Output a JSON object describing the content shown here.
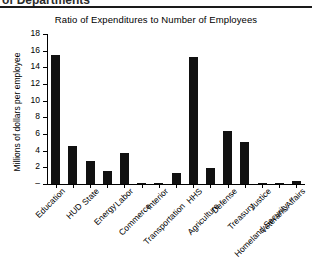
{
  "page": {
    "clipped_header": "of Departments"
  },
  "chart_data": {
    "type": "bar",
    "title": "Ratio of Expenditures to Number of Employees",
    "xlabel": "",
    "ylabel": "Millions of dollars per employee",
    "ylim": [
      0,
      18
    ],
    "ytick_labels": [
      "–",
      "2",
      "4",
      "6",
      "8",
      "10",
      "12",
      "14",
      "16",
      "18"
    ],
    "ytick_values": [
      0,
      2,
      4,
      6,
      8,
      10,
      12,
      14,
      16,
      18
    ],
    "grid": false,
    "legend": "none",
    "bar_color": "#111111",
    "categories": [
      "Education",
      "HUD",
      "State",
      "Energy",
      "Labor",
      "Commerce",
      "Interior",
      "Transportation",
      "HHS",
      "Agriculture",
      "Defense",
      "Treasury",
      "Justice",
      "Homeland Security",
      "Veterans Affairs"
    ],
    "values": [
      15.5,
      4.6,
      2.8,
      1.6,
      3.7,
      0.15,
      0.15,
      1.35,
      15.3,
      1.9,
      6.4,
      5.1,
      0.15,
      0.15,
      0.35
    ]
  }
}
